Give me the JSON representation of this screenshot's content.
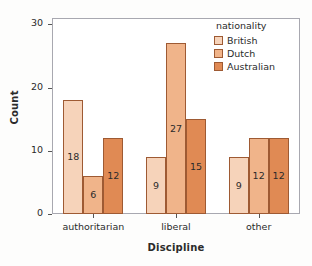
{
  "chart_data": {
    "type": "bar",
    "title": "",
    "xlabel": "Discipline",
    "ylabel": "Count",
    "categories": [
      "authoritarian",
      "liberal",
      "other"
    ],
    "series": [
      {
        "name": "British",
        "values": [
          18,
          9,
          9
        ],
        "color": "#f6d3ba"
      },
      {
        "name": "Dutch",
        "values": [
          6,
          27,
          12
        ],
        "color": "#f0b48a"
      },
      {
        "name": "Australian",
        "values": [
          12,
          15,
          12
        ],
        "color": "#e08a54"
      }
    ],
    "legend_title": "nationality",
    "legend_position": "top-right-inside",
    "ylim": [
      0,
      31
    ],
    "yticks": [
      0,
      10,
      20,
      30
    ],
    "grid": false,
    "bar_edge_color": "#9e5a33",
    "axis_color": "#a8a8b0",
    "value_labels_inside": true
  }
}
